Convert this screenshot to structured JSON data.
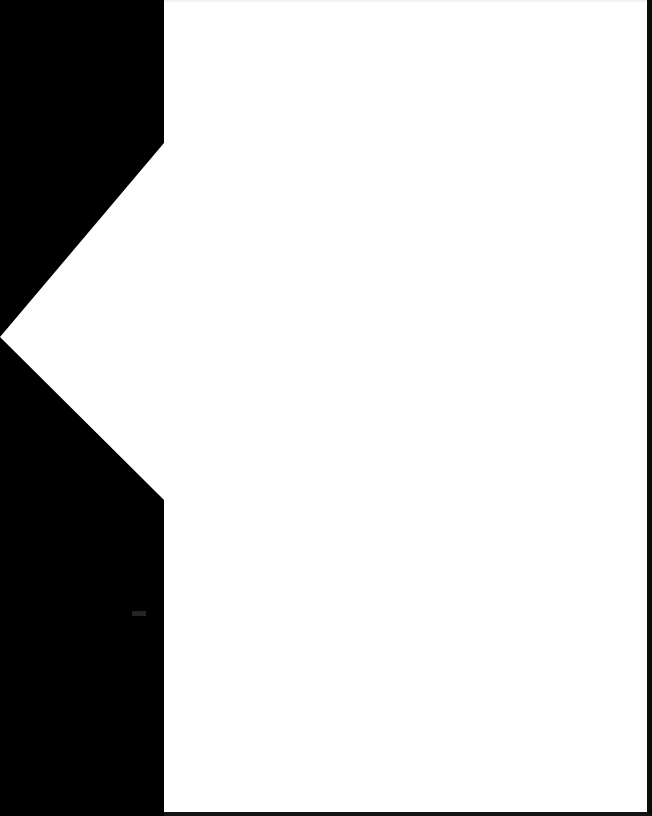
{
  "screen": {
    "width": 652,
    "height": 816,
    "background_color": "#ffffff"
  },
  "sidebar": {
    "name": "left-gutter",
    "color": "#000000",
    "width_px": 164,
    "label": "",
    "mark": {
      "label": "",
      "color": "#2b2b2b"
    }
  },
  "back_chevron": {
    "icon": "chevron-left-icon",
    "label": "",
    "color": "#ffffff",
    "apex_x": 0,
    "apex_y": 337,
    "top_y": 143,
    "bottom_y": 500,
    "base_x": 164
  },
  "content": {
    "name": "content-panel",
    "background_color": "#ffffff",
    "border_color": "#0b0b0b",
    "top_hairline_color": "#f2f2f4",
    "body_text": ""
  }
}
